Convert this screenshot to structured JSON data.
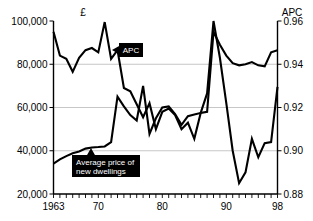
{
  "chart_data": {
    "type": "line",
    "title": "",
    "xlabel": "",
    "ylabel": "£",
    "y2label": "APC",
    "grid": true,
    "legend_position": "inline-callouts",
    "xlim": [
      1963,
      1998
    ],
    "ylim": [
      20000,
      100000
    ],
    "y2lim": [
      0.88,
      0.96
    ],
    "x_tick_labels": [
      "1963",
      "70",
      "80",
      "90",
      "98"
    ],
    "x_tick_values": [
      1963,
      1970,
      1980,
      1990,
      1998
    ],
    "y_tick_labels": [
      "100,000",
      "80,000",
      "60,000",
      "40,000",
      "20,000"
    ],
    "y_tick_values": [
      100000,
      80000,
      60000,
      40000,
      20000
    ],
    "y2_tick_labels": [
      "0.96",
      "0.94",
      "0.92",
      "0.90",
      "0.88"
    ],
    "y2_tick_values": [
      0.96,
      0.94,
      0.92,
      0.9,
      0.88
    ],
    "x": [
      1963,
      1964,
      1965,
      1966,
      1967,
      1968,
      1969,
      1970,
      1971,
      1972,
      1973,
      1974,
      1975,
      1976,
      1977,
      1978,
      1979,
      1980,
      1981,
      1982,
      1983,
      1984,
      1985,
      1986,
      1987,
      1988,
      1989,
      1990,
      1991,
      1992,
      1993,
      1994,
      1995,
      1996,
      1997,
      1998
    ],
    "series": [
      {
        "name": "APC",
        "axis": "right",
        "units": "ratio",
        "values": [
          0.955,
          0.944,
          0.9425,
          0.9365,
          0.943,
          0.9465,
          0.9475,
          0.9455,
          0.9595,
          0.9425,
          0.9465,
          0.929,
          0.9275,
          0.9215,
          0.9155,
          0.922,
          0.91,
          0.918,
          0.9195,
          0.9165,
          0.91,
          0.913,
          0.9055,
          0.9175,
          0.918,
          0.955,
          0.949,
          0.944,
          0.9405,
          0.9395,
          0.94,
          0.941,
          0.9395,
          0.939,
          0.9455,
          0.9465
        ]
      },
      {
        "name": "Average price of new dwellings",
        "axis": "left",
        "units": "GBP",
        "values": [
          34000,
          36000,
          37500,
          38800,
          39700,
          41000,
          41500,
          41700,
          42000,
          44000,
          65000,
          60500,
          56500,
          54000,
          70000,
          47800,
          55000,
          60000,
          60500,
          57000,
          52000,
          56000,
          56800,
          57500,
          66500,
          100000,
          83000,
          62000,
          40000,
          25000,
          30000,
          45500,
          37000,
          43500,
          44000,
          69500
        ]
      }
    ],
    "annotations": [
      {
        "id": "apc-callout",
        "label": "APC",
        "arrow_direction": "left"
      },
      {
        "id": "dwellings-callout",
        "label_line1": "Average price of",
        "label_line2": "new dwellings",
        "arrow_direction": "up"
      }
    ]
  }
}
